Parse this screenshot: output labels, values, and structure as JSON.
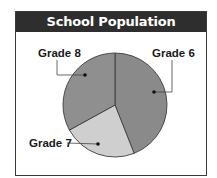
{
  "chart_data": {
    "type": "pie",
    "title": "School Population",
    "categories": [
      "Grade 6",
      "Grade 7",
      "Grade 8"
    ],
    "values": [
      44,
      23,
      33
    ],
    "units": "percent (estimated from slice angles)",
    "colors": {
      "Grade 6": "#8a8a8a",
      "Grade 7": "#cfcfcf",
      "Grade 8": "#8f8f8f"
    },
    "start_angle_deg": 0,
    "direction": "clockwise",
    "legend": "none (leader-line labels)"
  },
  "title": "School Population",
  "labels": {
    "grade6": "Grade 6",
    "grade7": "Grade 7",
    "grade8": "Grade 8"
  },
  "colors": {
    "title_bg": "#2e2e2e",
    "title_text": "#ffffff",
    "border": "#3a3a3a",
    "outline": "#3c3c3c"
  }
}
